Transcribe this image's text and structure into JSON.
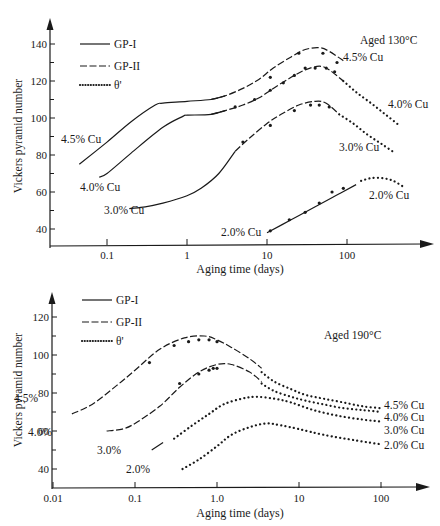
{
  "chart_data": [
    {
      "type": "line",
      "title": "Aged 130°C",
      "annotation": "Aged 130°C",
      "xlabel": "Aging time (days)",
      "ylabel": "Vickers pyramid number",
      "xscale": "log",
      "xlim": [
        0.03,
        700
      ],
      "ylim": [
        35,
        150
      ],
      "xticks": [
        0.1,
        1,
        10,
        100
      ],
      "xtick_labels": [
        "0.1",
        "1",
        "10",
        "100"
      ],
      "yticks": [
        40,
        60,
        80,
        100,
        120,
        140
      ],
      "ytick_labels": [
        "40",
        "60",
        "80",
        "100",
        "120",
        "140"
      ],
      "legend": [
        "GP-I",
        "GP-II",
        "θ'"
      ],
      "legend_position": "upper left",
      "series": [
        {
          "name": "4.5% Cu GP-I",
          "style": "GP-I",
          "x": [
            0.045,
            0.1,
            0.2,
            0.4,
            0.5,
            1,
            2,
            3
          ],
          "y": [
            75,
            87,
            98,
            107,
            108,
            109,
            110,
            112
          ]
        },
        {
          "name": "4.5% Cu GP-II",
          "style": "GP-II",
          "x": [
            2,
            3,
            5,
            8,
            12,
            20,
            30,
            45,
            60,
            90
          ],
          "y": [
            110,
            112,
            116,
            121,
            127,
            133,
            137,
            138,
            136,
            131
          ]
        },
        {
          "name": "4.0% Cu GP-I",
          "style": "GP-I",
          "x": [
            0.08,
            0.1,
            0.2,
            0.5,
            0.9,
            1,
            2,
            3
          ],
          "y": [
            68,
            70,
            81,
            95,
            101,
            101.5,
            102,
            104
          ]
        },
        {
          "name": "4.0% Cu GP-II",
          "style": "GP-II",
          "x": [
            2,
            3,
            5,
            8,
            12,
            20,
            30,
            45,
            60,
            90
          ],
          "y": [
            102,
            104,
            107,
            111,
            116,
            122,
            126,
            128,
            126,
            120
          ]
        },
        {
          "name": "4.0% Cu θ'",
          "style": "θ'",
          "x": [
            90,
            130,
            200,
            300,
            450
          ],
          "y": [
            120,
            114,
            108,
            102,
            96
          ]
        },
        {
          "name": "3.0% Cu GP-I",
          "style": "GP-I",
          "x": [
            0.19,
            0.3,
            0.5,
            1,
            1.5,
            2.5,
            4
          ],
          "y": [
            51,
            52,
            54,
            58,
            62,
            70,
            82
          ]
        },
        {
          "name": "3.0% Cu GP-II",
          "style": "GP-II",
          "x": [
            4,
            6,
            10,
            15,
            25,
            40,
            55,
            80
          ],
          "y": [
            82,
            89,
            97,
            102,
            107,
            109,
            108,
            102
          ]
        },
        {
          "name": "3.0% Cu θ'",
          "style": "θ'",
          "x": [
            80,
            120,
            180,
            270,
            400
          ],
          "y": [
            102,
            97,
            91,
            86,
            81
          ]
        },
        {
          "name": "2.0% Cu GP-I",
          "style": "GP-I",
          "x": [
            10,
            20,
            40,
            80,
            130
          ],
          "y": [
            38,
            45,
            52,
            59,
            64
          ]
        },
        {
          "name": "2.0% Cu θ'",
          "style": "θ'",
          "x": [
            150,
            200,
            280,
            380,
            500
          ],
          "y": [
            66,
            67.5,
            67.5,
            66,
            63
          ]
        }
      ],
      "data_points": {
        "4.5% Cu": {
          "x": [
            11,
            25,
            50,
            75
          ],
          "y": [
            122,
            135,
            135,
            130
          ]
        },
        "4.0% Cu": {
          "x": [
            4,
            7,
            11,
            16,
            22,
            30,
            40,
            55,
            70
          ],
          "y": [
            106,
            110,
            115,
            119,
            123,
            127,
            127,
            127,
            125
          ]
        },
        "3.0% Cu": {
          "x": [
            5,
            11,
            22,
            35,
            45,
            60
          ],
          "y": [
            87,
            96,
            104,
            107,
            107,
            106
          ]
        },
        "2.0% Cu": {
          "x": [
            11,
            19,
            30,
            45,
            65,
            90
          ],
          "y": [
            39,
            45,
            49,
            54,
            60,
            62
          ]
        }
      },
      "curve_labels": [
        "4.5% Cu",
        "4.0% Cu",
        "3.0% Cu",
        "2.0% Cu",
        "4.5% Cu",
        "4.0% Cu",
        "3.0% Cu",
        "2.0% Cu"
      ]
    },
    {
      "type": "line",
      "title": "Aged 190°C",
      "annotation": "Aged 190°C",
      "xlabel": "Aging time (days)",
      "ylabel": "Vickers pyramid number",
      "xscale": "log",
      "xlim": [
        0.01,
        300
      ],
      "ylim": [
        35,
        130
      ],
      "xticks": [
        0.01,
        0.1,
        1.0,
        10,
        100
      ],
      "xtick_labels": [
        "0.01",
        "0.1",
        "1.0",
        "10",
        "100"
      ],
      "yticks": [
        40,
        60,
        80,
        100,
        120
      ],
      "ytick_labels": [
        "40",
        "60",
        "80",
        "100",
        "120"
      ],
      "legend": [
        "GP-I",
        "GP-II",
        "θ'"
      ],
      "legend_position": "upper left",
      "series": [
        {
          "name": "4.5% GP-II",
          "style": "GP-II",
          "x": [
            0.017,
            0.03,
            0.06,
            0.1,
            0.2,
            0.4,
            0.7,
            1.0,
            1.5,
            2.5,
            3.5
          ],
          "y": [
            69,
            74,
            84,
            92,
            103,
            109,
            110,
            108,
            104,
            98,
            93
          ]
        },
        {
          "name": "4.5% θ'",
          "style": "θ'",
          "x": [
            3.5,
            5,
            8,
            12,
            20,
            35,
            60,
            100
          ],
          "y": [
            91,
            86,
            82,
            79,
            77,
            75,
            73,
            72
          ]
        },
        {
          "name": "4.0% GP-II",
          "style": "GP-II",
          "x": [
            0.045,
            0.07,
            0.1,
            0.2,
            0.35,
            0.6,
            1.0,
            1.5,
            2.5,
            3.5
          ],
          "y": [
            60,
            61,
            64,
            73,
            83,
            91,
            95,
            95,
            91,
            86
          ]
        },
        {
          "name": "4.0% θ'",
          "style": "θ'",
          "x": [
            3.5,
            5,
            8,
            12,
            20,
            35,
            60,
            100
          ],
          "y": [
            85,
            81,
            78,
            76,
            74,
            72,
            71,
            70
          ]
        },
        {
          "name": "3.0% GP-I",
          "style": "GP-I",
          "x": [
            0.16,
            0.22
          ],
          "y": [
            50,
            54
          ]
        },
        {
          "name": "3.0% θ'",
          "style": "θ'",
          "x": [
            0.3,
            0.5,
            0.8,
            1.2,
            2,
            3,
            5,
            8,
            15,
            30,
            60,
            100
          ],
          "y": [
            56,
            63,
            69,
            74,
            77,
            78,
            77,
            75,
            71,
            68,
            66,
            65
          ]
        },
        {
          "name": "2.0% θ'",
          "style": "θ'",
          "x": [
            0.38,
            0.6,
            1.0,
            1.5,
            2.5,
            4,
            6,
            10,
            20,
            50,
            100
          ],
          "y": [
            40,
            45,
            52,
            58,
            62,
            64,
            63,
            61,
            58,
            55,
            53
          ]
        }
      ],
      "data_points": {
        "4.5%": {
          "x": [
            0.15,
            0.3,
            0.45,
            0.6,
            0.8,
            1.0
          ],
          "y": [
            96,
            105,
            107,
            108,
            108,
            107
          ]
        },
        "4.0%": {
          "x": [
            0.35,
            0.6,
            0.8,
            0.9,
            1.0
          ],
          "y": [
            85,
            90,
            92,
            93,
            93
          ]
        }
      },
      "curve_labels_left": [
        "4.5%",
        "4.0%",
        "3.0%",
        "2.0%"
      ],
      "curve_labels_right": [
        "4.5% Cu",
        "4.0% Cu",
        "3.0% Cu",
        "2.0% Cu"
      ]
    }
  ],
  "top": {
    "annotation": "Aged 130°C",
    "ylabel": "Vickers pyramid number",
    "xlabel": "Aging time (days)",
    "legend": {
      "gp1": "GP-I",
      "gp2": "GP-II",
      "theta": "θ'"
    },
    "labels": {
      "l45": "4.5% Cu",
      "l40": "4.0% Cu",
      "l30": "3.0% Cu",
      "l20": "2.0% Cu",
      "r45": "4.5% Cu",
      "r40": "4.0% Cu",
      "r30": "3.0% Cu",
      "r20": "2.0% Cu"
    }
  },
  "bottom": {
    "annotation": "Aged 190°C",
    "ylabel": "Vickers pyramid number",
    "xlabel": "Aging time (days)",
    "legend": {
      "gp1": "GP-I",
      "gp2": "GP-II",
      "theta": "θ'"
    },
    "labels": {
      "l45": "4.5%",
      "l40": "4.0%",
      "l30": "3.0%",
      "l20": "2.0%",
      "r45": "4.5% Cu",
      "r40": "4.0% Cu",
      "r30": "3.0% Cu",
      "r20": "2.0% Cu"
    }
  }
}
